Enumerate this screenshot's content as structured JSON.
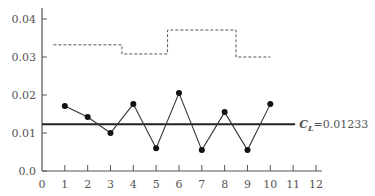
{
  "chart_data": {
    "type": "line",
    "title": "",
    "xlabel": "",
    "ylabel": "",
    "xlim": [
      0,
      12
    ],
    "ylim": [
      0,
      0.04
    ],
    "x_ticks": [
      0,
      1,
      2,
      3,
      4,
      5,
      6,
      7,
      8,
      9,
      10,
      11,
      12
    ],
    "x_tick_labels": [
      "0",
      "1",
      "2",
      "3",
      "4",
      "5",
      "6",
      "7",
      "8",
      "9",
      "10",
      "11",
      "12"
    ],
    "y_ticks": [
      0,
      0.01,
      0.02,
      0.03,
      0.04
    ],
    "y_tick_labels": [
      "0.0",
      "0.01",
      "0.02",
      "0.03",
      "0.04"
    ],
    "grid": false,
    "series": [
      {
        "name": "sample proportion",
        "style": "solid line with filled circle markers",
        "x": [
          1,
          2,
          3,
          4,
          5,
          6,
          7,
          8,
          9,
          10
        ],
        "values": [
          0.0171,
          0.0142,
          0.01,
          0.0176,
          0.006,
          0.0205,
          0.0055,
          0.0155,
          0.0055,
          0.0176
        ]
      },
      {
        "name": "upper control limit",
        "style": "dashed step",
        "steps": [
          {
            "x_start": 0.5,
            "x_end": 3.5,
            "value": 0.0332
          },
          {
            "x_start": 3.5,
            "x_end": 5.5,
            "value": 0.0308
          },
          {
            "x_start": 5.5,
            "x_end": 8.5,
            "value": 0.0371
          },
          {
            "x_start": 8.5,
            "x_end": 10.0,
            "value": 0.03
          }
        ]
      },
      {
        "name": "center line",
        "style": "solid thick horizontal",
        "value": 0.01233,
        "x_start": 0,
        "x_end": 11
      }
    ],
    "annotations": [
      {
        "text_main": "C",
        "text_sub": "L",
        "text_rest": "=0.01233",
        "x": 11,
        "y": 0.01233
      }
    ]
  }
}
